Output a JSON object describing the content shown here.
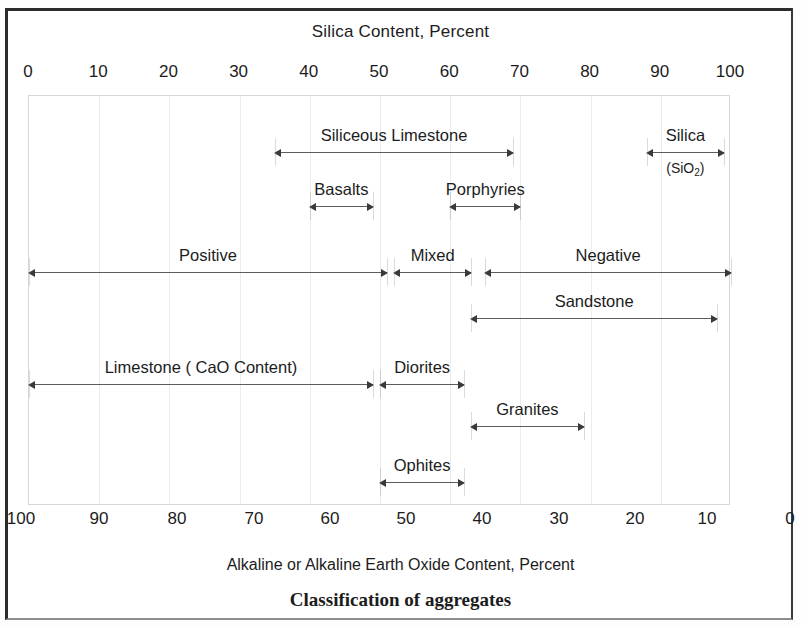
{
  "figure": {
    "caption": "Classification of aggregates",
    "top_axis_title": "Silica Content, Percent",
    "bottom_axis_title": "Alkaline or Alkaline Earth Oxide Content, Percent"
  },
  "chart_data": {
    "type": "bar",
    "title": "Classification of aggregates",
    "xlabel": "Silica Content, Percent",
    "xlabel_secondary": "Alkaline or Alkaline Earth Oxide Content, Percent",
    "ylabel": "",
    "grid": true,
    "legend": "none",
    "axes": [
      {
        "name": "silica",
        "position": "top",
        "label": "Silica Content, Percent",
        "range": [
          0,
          100
        ],
        "ticks": [
          0,
          10,
          20,
          30,
          40,
          50,
          60,
          70,
          80,
          90,
          100
        ],
        "tick_labels": [
          "0",
          "10",
          "20",
          "30",
          "40",
          "50",
          "60",
          "70",
          "80",
          "90",
          "100"
        ]
      },
      {
        "name": "alkaline_oxide",
        "position": "bottom",
        "label": "Alkaline or Alkaline Earth Oxide Content, Percent",
        "range": [
          100,
          0
        ],
        "ticks": [
          100,
          90,
          80,
          70,
          60,
          50,
          40,
          30,
          20,
          10,
          0
        ],
        "tick_labels": [
          "100",
          "90",
          "80",
          "70",
          "60",
          "50",
          "40",
          "30",
          "20",
          "10",
          "0"
        ]
      }
    ],
    "categories": [
      "Siliceous Limestone",
      "Silica (SiO2)",
      "Basalts",
      "Porphyries",
      "Positive",
      "Mixed",
      "Negative",
      "Sandstone",
      "Limestone ( CaO  Content)",
      "Diorites",
      "Granites",
      "Ophites"
    ],
    "ranges": [
      {
        "label": "Siliceous Limestone",
        "row": 1,
        "silica_start": 35,
        "silica_end": 69,
        "alkaline_start": 65,
        "alkaline_end": 31
      },
      {
        "label": "Silica",
        "sublabel": "(SiO2)",
        "row": 1,
        "silica_start": 88,
        "silica_end": 99,
        "alkaline_start": 12,
        "alkaline_end": 1
      },
      {
        "label": "Basalts",
        "row": 2,
        "silica_start": 40,
        "silica_end": 49,
        "alkaline_start": 60,
        "alkaline_end": 51
      },
      {
        "label": "Porphyries",
        "row": 2,
        "silica_start": 60,
        "silica_end": 70,
        "alkaline_start": 40,
        "alkaline_end": 30
      },
      {
        "label": "Positive",
        "row": 3,
        "silica_start": 0,
        "silica_end": 51,
        "alkaline_start": 100,
        "alkaline_end": 49
      },
      {
        "label": "Mixed",
        "row": 3,
        "silica_start": 52,
        "silica_end": 63,
        "alkaline_start": 48,
        "alkaline_end": 37
      },
      {
        "label": "Negative",
        "row": 3,
        "silica_start": 65,
        "silica_end": 100,
        "alkaline_start": 35,
        "alkaline_end": 0
      },
      {
        "label": "Sandstone",
        "row": 4,
        "silica_start": 63,
        "silica_end": 98,
        "alkaline_start": 37,
        "alkaline_end": 2
      },
      {
        "label": "Limestone ( CaO  Content)",
        "row": 5,
        "silica_start": 0,
        "silica_end": 49,
        "alkaline_start": 100,
        "alkaline_end": 51
      },
      {
        "label": "Diorites",
        "row": 5,
        "silica_start": 50,
        "silica_end": 62,
        "alkaline_start": 50,
        "alkaline_end": 38
      },
      {
        "label": "Granites",
        "row": 6,
        "silica_start": 63,
        "silica_end": 79,
        "alkaline_start": 37,
        "alkaline_end": 21
      },
      {
        "label": "Ophites",
        "row": 7,
        "silica_start": 50,
        "silica_end": 62,
        "alkaline_start": 50,
        "alkaline_end": 38
      }
    ]
  },
  "top_ticks": [
    "0",
    "10",
    "20",
    "30",
    "40",
    "50",
    "60",
    "70",
    "80",
    "90",
    "100"
  ],
  "bottom_ticks": [
    "100",
    "90",
    "80",
    "70",
    "60",
    "50",
    "40",
    "30",
    "20",
    "10",
    "0"
  ],
  "labels": {
    "siliceous_limestone": "Siliceous Limestone",
    "silica": "Silica",
    "silica_formula_open": "(SiO",
    "silica_formula_sub": "2",
    "silica_formula_close": ")",
    "basalts": "Basalts",
    "porphyries": "Porphyries",
    "positive": "Positive",
    "mixed": "Mixed",
    "negative": "Negative",
    "sandstone": "Sandstone",
    "limestone": "Limestone ( CaO  Content)",
    "diorites": "Diorites",
    "granites": "Granites",
    "ophites": "Ophites"
  }
}
